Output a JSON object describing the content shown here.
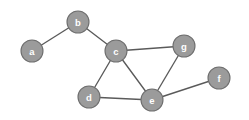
{
  "graph": {
    "background_color": "#ffffff",
    "node_fill_color": "#9b9b9b",
    "node_border_color": "#6e6e6e",
    "node_label_color": "#ffffff",
    "edge_color": "#5a5a5a",
    "node_radius": 11,
    "nodes": [
      {
        "id": "a",
        "label": "a",
        "x": 32,
        "y": 51
      },
      {
        "id": "b",
        "label": "b",
        "x": 78,
        "y": 22
      },
      {
        "id": "c",
        "label": "c",
        "x": 116,
        "y": 51
      },
      {
        "id": "d",
        "label": "d",
        "x": 89,
        "y": 97
      },
      {
        "id": "e",
        "label": "e",
        "x": 152,
        "y": 100
      },
      {
        "id": "f",
        "label": "f",
        "x": 219,
        "y": 78
      },
      {
        "id": "g",
        "label": "g",
        "x": 184,
        "y": 46
      }
    ],
    "edges": [
      {
        "from": "a",
        "to": "b"
      },
      {
        "from": "b",
        "to": "c"
      },
      {
        "from": "c",
        "to": "g"
      },
      {
        "from": "c",
        "to": "d"
      },
      {
        "from": "c",
        "to": "e"
      },
      {
        "from": "d",
        "to": "e"
      },
      {
        "from": "e",
        "to": "g"
      },
      {
        "from": "e",
        "to": "f"
      }
    ]
  }
}
